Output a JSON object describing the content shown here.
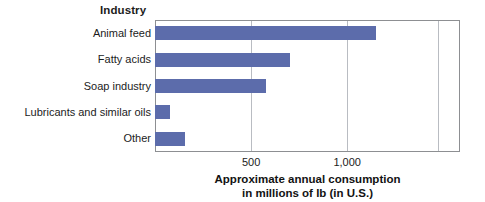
{
  "chart_data": {
    "type": "bar",
    "orientation": "horizontal",
    "title": "",
    "xlabel": "Approximate annual consumption in millions of lb (in U.S.)",
    "xlabel_lines": [
      "Approximate annual consumption",
      "in millions of lb (in U.S.)"
    ],
    "ylabel": "Industry",
    "categories": [
      "Animal feed",
      "Fatty acids",
      "Soap industry",
      "Lubricants and similar oils",
      "Other"
    ],
    "values": [
      1150,
      700,
      580,
      80,
      155
    ],
    "xlim": [
      0,
      1587
    ],
    "xticks": [
      500,
      1000
    ],
    "xtick_labels": [
      "500",
      "1,000"
    ],
    "gridline_values": [
      500,
      1000,
      1470
    ],
    "grid": true,
    "legend": "none",
    "bar_color": "#5c6cab",
    "gridline_color": "#b9bcc2",
    "frame_color": "#8d8f92",
    "background": "#ffffff"
  }
}
